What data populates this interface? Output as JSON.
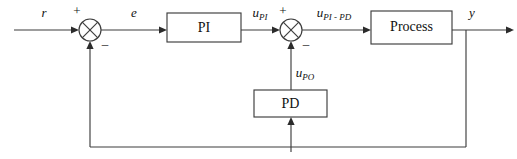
{
  "diagram": {
    "background_color": "#ffffff",
    "line_color": "#3d3d3d",
    "text_color": "#111111",
    "blocks": [
      {
        "id": "pi",
        "label": "PI",
        "x": 167,
        "y": 13,
        "w": 74,
        "h": 29
      },
      {
        "id": "process",
        "label": "Process",
        "x": 371,
        "y": 11,
        "w": 81,
        "h": 33
      },
      {
        "id": "pd",
        "label": "PD",
        "x": 254,
        "y": 90,
        "w": 73,
        "h": 27
      }
    ],
    "summing_junctions": [
      {
        "id": "sum1",
        "cx": 90,
        "cy": 30,
        "r": 11,
        "plus_sign": "+",
        "minus_sign": "–"
      },
      {
        "id": "sum2",
        "cx": 291,
        "cy": 30,
        "r": 11,
        "plus_sign": "+",
        "minus_sign": "–"
      }
    ],
    "signals": [
      {
        "id": "r",
        "base": "r",
        "sub": "",
        "x": 44,
        "y": 17
      },
      {
        "id": "e",
        "base": "e",
        "sub": "",
        "x": 134,
        "y": 17
      },
      {
        "id": "u_pi",
        "base": "u",
        "sub": "PI",
        "x": 262,
        "y": 17
      },
      {
        "id": "u_pi_pd",
        "base": "u",
        "sub": "PI - PD",
        "x": 336,
        "y": 17
      },
      {
        "id": "u_po",
        "base": "u",
        "sub": "PO",
        "x": 306,
        "y": 77
      },
      {
        "id": "y",
        "base": "y",
        "sub": "",
        "x": 472,
        "y": 17
      }
    ]
  }
}
